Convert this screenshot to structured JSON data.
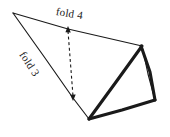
{
  "figure": {
    "title": "",
    "kind": "origami-fold-diagram",
    "background_color": "#ffffff",
    "ink_color": "#1a1a1a",
    "labels": {
      "fold4": "fold 4",
      "fold3": "fold 3"
    },
    "annotations": {
      "dashed_arrow_name": "fold-4-motion-arrow",
      "dashed_style": "dashed double-headed arrow"
    },
    "geometry": {
      "vertices": {
        "left_apex": [
          13,
          13
        ],
        "top_right": [
          142,
          46
        ],
        "bottom_center": [
          89,
          119
        ],
        "bottom_right": [
          155,
          100
        ],
        "top_edge_midpoint": [
          68,
          29
        ],
        "crease_bend": [
          73,
          98
        ]
      },
      "thin_edges": [
        [
          [
            13,
            13
          ],
          [
            142,
            46
          ]
        ],
        [
          [
            13,
            13
          ],
          [
            73,
            98
          ]
        ],
        [
          [
            73,
            98
          ],
          [
            89,
            119
          ]
        ],
        [
          [
            142,
            46
          ],
          [
            155,
            100
          ]
        ]
      ],
      "thick_edges": [
        [
          [
            142,
            46
          ],
          [
            89,
            119
          ]
        ],
        [
          [
            89,
            119
          ],
          [
            155,
            100
          ]
        ],
        [
          [
            142,
            46
          ],
          [
            155,
            100
          ]
        ]
      ],
      "dashed_arrow": [
        [
          68,
          29
        ],
        [
          73,
          98
        ]
      ]
    }
  }
}
